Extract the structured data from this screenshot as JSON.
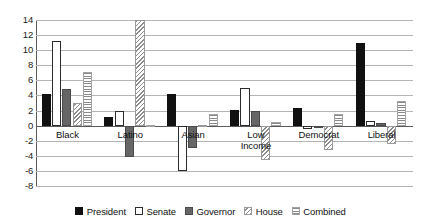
{
  "chart_data": {
    "type": "bar",
    "title": "",
    "subtitle": "",
    "xlabel": "",
    "ylabel": "",
    "ylim": [
      -8,
      14
    ],
    "ytick_values": [
      14,
      12,
      10,
      8,
      6,
      4,
      2,
      0,
      -2,
      -4,
      -6,
      -8
    ],
    "ytick_labels": [
      "14",
      "12",
      "10",
      "8",
      "6",
      "4",
      "2",
      "0",
      "-2",
      "-4",
      "-6",
      "-8"
    ],
    "grid": true,
    "legend_position": "bottom",
    "categories": [
      "Black",
      "Latino",
      "Asian",
      "Low\nIncome",
      "Democrat",
      "Liberal"
    ],
    "series": [
      {
        "name": "President",
        "fill": "solid-black",
        "color": "#111111",
        "values": [
          4.2,
          1.1,
          4.2,
          2.1,
          2.4,
          11.0
        ]
      },
      {
        "name": "Senate",
        "fill": "open-white",
        "color": "#ffffff",
        "values": [
          11.2,
          2.0,
          -6.0,
          5.0,
          -0.4,
          0.6
        ]
      },
      {
        "name": "Governor",
        "fill": "solid-gray",
        "color": "#666666",
        "values": [
          4.9,
          -4.2,
          -2.9,
          1.9,
          -0.3,
          0.3
        ]
      },
      {
        "name": "House",
        "fill": "diagonal-hatch",
        "color": "#8d8d8d",
        "values": [
          3.0,
          14.0,
          0.1,
          -4.5,
          -3.2,
          -2.5
        ]
      },
      {
        "name": "Combined",
        "fill": "horizontal-stripe",
        "color": "#8a8a8a",
        "values": [
          7.1,
          0.1,
          1.5,
          0.5,
          1.5,
          3.3
        ]
      }
    ]
  },
  "legend": {
    "items": [
      {
        "label": "President"
      },
      {
        "label": "Senate"
      },
      {
        "label": "Governor"
      },
      {
        "label": "House"
      },
      {
        "label": "Combined"
      }
    ]
  }
}
